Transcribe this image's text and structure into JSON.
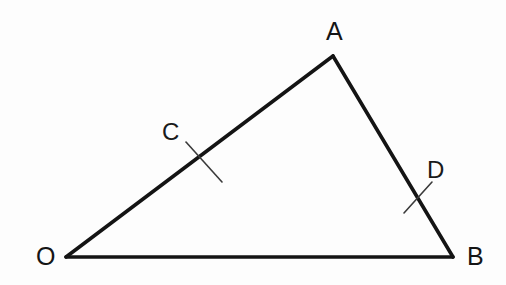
{
  "figure": {
    "kind": "geometry-diagram",
    "shape": "triangle",
    "background_color": "#fdfdfd",
    "stroke_color": "#141414",
    "tick_color": "#3a3a3a",
    "stroke_width": 3.6,
    "tick_width": 1.6,
    "canvas": {
      "width": 506,
      "height": 285
    },
    "vertices": [
      {
        "id": "O",
        "label": "O",
        "x": 66,
        "y": 257
      },
      {
        "id": "A",
        "label": "A",
        "x": 333,
        "y": 56
      },
      {
        "id": "B",
        "label": "B",
        "x": 453,
        "y": 257
      }
    ],
    "edges": [
      {
        "id": "OA",
        "from": "O",
        "to": "A"
      },
      {
        "id": "AB",
        "from": "A",
        "to": "B"
      },
      {
        "id": "OB",
        "from": "O",
        "to": "B"
      }
    ],
    "marked_points": [
      {
        "id": "C",
        "label": "C",
        "on_edge": "OA",
        "x": 204,
        "y": 162
      },
      {
        "id": "D",
        "label": "D",
        "on_edge": "AB",
        "x": 418,
        "y": 198
      }
    ],
    "tick_marks": [
      {
        "for_point": "C",
        "x1": 186,
        "y1": 142,
        "x2": 222,
        "y2": 182
      },
      {
        "for_point": "D",
        "x1": 404,
        "y1": 213,
        "x2": 432,
        "y2": 182
      }
    ],
    "labels": {
      "A": "A",
      "B": "B",
      "O": "O",
      "C": "C",
      "D": "D"
    }
  }
}
